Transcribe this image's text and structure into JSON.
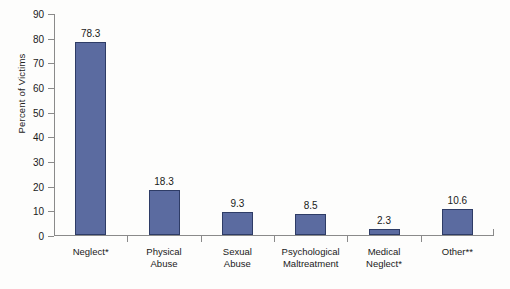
{
  "chart_data": {
    "type": "bar",
    "title": "",
    "subtitle": "",
    "xlabel": "",
    "ylabel": "Percent of Victims",
    "ylim": [
      0,
      90
    ],
    "ytick_step": 10,
    "yticks": [
      0,
      10,
      20,
      30,
      40,
      50,
      60,
      70,
      80,
      90
    ],
    "grid": false,
    "legend": null,
    "categories": [
      "Neglect*",
      "Physical\nAbuse",
      "Sexual\nAbuse",
      "Psychological\nMaltreatment",
      "Medical\nNeglect*",
      "Other**"
    ],
    "values": [
      78.3,
      18.3,
      9.3,
      8.5,
      2.3,
      10.6
    ],
    "value_labels": [
      "78.3",
      "18.3",
      "9.3",
      "8.5",
      "2.3",
      "10.6"
    ],
    "bar_color": "#5b6ba0",
    "bar_edge_color": "#2e3c66",
    "axis_color": "#8a8a8a",
    "background_color": "#fdfdfc"
  }
}
